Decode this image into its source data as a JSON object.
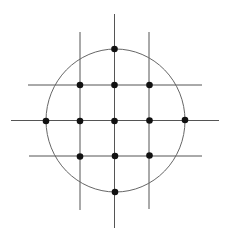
{
  "diagram": {
    "width": 227,
    "height": 236,
    "colors": {
      "background": "#ffffff",
      "line": "#555555",
      "circle": "#666666",
      "dot": "#111111"
    },
    "circle": {
      "cx": 115.5,
      "cy": 120.5,
      "rx": 69.5,
      "ry": 71.5
    },
    "vertical_lines": [
      {
        "x": 80,
        "y1": 32,
        "y2": 210
      },
      {
        "x": 114.5,
        "y1": 14,
        "y2": 228
      },
      {
        "x": 149,
        "y1": 32,
        "y2": 209
      }
    ],
    "horizontal_lines": [
      {
        "y": 85,
        "x1": 28,
        "x2": 202
      },
      {
        "y": 120.5,
        "x1": 11,
        "x2": 219
      },
      {
        "y": 156,
        "x1": 29,
        "x2": 202
      }
    ],
    "dots": [
      {
        "x": 114.5,
        "y": 49
      },
      {
        "x": 80,
        "y": 85
      },
      {
        "x": 114.5,
        "y": 85
      },
      {
        "x": 149.5,
        "y": 85
      },
      {
        "x": 46,
        "y": 121
      },
      {
        "x": 80,
        "y": 121
      },
      {
        "x": 114.5,
        "y": 121
      },
      {
        "x": 149.5,
        "y": 120.5
      },
      {
        "x": 185,
        "y": 120
      },
      {
        "x": 80,
        "y": 156.5
      },
      {
        "x": 115,
        "y": 156
      },
      {
        "x": 149.5,
        "y": 155.5
      },
      {
        "x": 115,
        "y": 192
      }
    ],
    "dot_radius": 3.3
  }
}
